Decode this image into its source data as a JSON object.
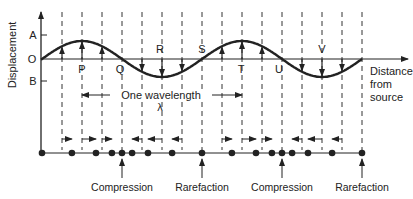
{
  "figure": {
    "y_axis_label": "Displacement",
    "y_ticks": {
      "A": "A",
      "O": "O",
      "B": "B"
    },
    "x_axis_label_lines": [
      "Distance",
      "from",
      "source"
    ],
    "wave_points": [
      "P",
      "Q",
      "R",
      "S",
      "T",
      "U",
      "V"
    ],
    "wavelength_label": "One wavelength",
    "wavelength_symbol": "λ",
    "annotations": [
      "Compression",
      "Rarefaction",
      "Compression",
      "Rarefaction"
    ],
    "line_color": "#222222"
  },
  "chart_data": {
    "type": "line",
    "title": "",
    "xlabel": "Distance from source",
    "ylabel": "Displacement",
    "wavelengths_shown": 2,
    "samples_per_wavelength": 8,
    "amplitude_labels": {
      "max": "A",
      "zero": "O",
      "min": "B"
    },
    "sample_phases_eighths": [
      0,
      1,
      2,
      3,
      4,
      5,
      6,
      7,
      8,
      9,
      10,
      11,
      12,
      13,
      14,
      15,
      16
    ],
    "displacement_normalized": [
      0,
      0.707,
      1,
      0.707,
      0,
      -0.707,
      -1,
      -0.707,
      0,
      0.707,
      1,
      0.707,
      0,
      -0.707,
      -1,
      -0.707,
      0
    ],
    "labeled_points": [
      {
        "label": "P",
        "phase_eighths": 2
      },
      {
        "label": "Q",
        "phase_eighths": 4
      },
      {
        "label": "R",
        "phase_eighths": 6
      },
      {
        "label": "S",
        "phase_eighths": 8
      },
      {
        "label": "T",
        "phase_eighths": 10
      },
      {
        "label": "U",
        "phase_eighths": 12
      },
      {
        "label": "V",
        "phase_eighths": 14
      }
    ],
    "wavelength_span_eighths": [
      2,
      10
    ],
    "particle_annotations": [
      {
        "label": "Compression",
        "phase_eighths": 4
      },
      {
        "label": "Rarefaction",
        "phase_eighths": 8
      },
      {
        "label": "Compression",
        "phase_eighths": 12
      },
      {
        "label": "Rarefaction",
        "phase_eighths": 16
      }
    ]
  }
}
